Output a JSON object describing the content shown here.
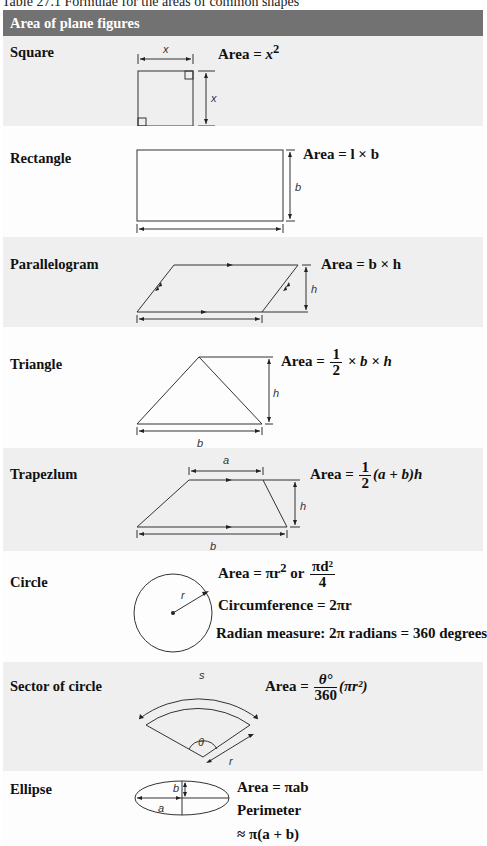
{
  "caption": "Table 27.1 Formulae for the areas of common shapes",
  "header": {
    "title": "Area of plane figures",
    "bg_color": "#727272"
  },
  "rows": [
    {
      "label": "Square",
      "dims": {
        "side_top": "x",
        "side_right": "x"
      },
      "formula": {
        "prefix": "Area = ",
        "var": "x",
        "sup": "2"
      }
    },
    {
      "label": "Rectangle",
      "dims": {
        "height": "b",
        "length": "l"
      },
      "formula": {
        "text": "Area = l × b"
      }
    },
    {
      "label": "Parallelogram",
      "dims": {
        "height": "h",
        "base": "b"
      },
      "formula": {
        "text": "Area = b × h"
      }
    },
    {
      "label": "Triangle",
      "dims": {
        "height": "h",
        "base": "b"
      },
      "formula": {
        "prefix": "Area = ",
        "num": "1",
        "den": "2",
        "suffix": " × b × h"
      }
    },
    {
      "label": "Trapezlum",
      "dims": {
        "top": "a",
        "height": "h",
        "base": "b"
      },
      "formula": {
        "prefix": "Area = ",
        "num": "1",
        "den": "2",
        "suffix": "(a + b)h"
      }
    },
    {
      "label": "Circle",
      "dims": {
        "radius": "r"
      },
      "formula": {
        "area_prefix": "Area = πr",
        "area_sup": "2",
        "or": " or ",
        "num": "πd²",
        "den": "4",
        "circumference": "Circumference = 2πr",
        "radian": "Radian measure: 2π radians = 360 degrees"
      }
    },
    {
      "label": "Sector of circle",
      "dims": {
        "arc": "s",
        "angle": "θ",
        "radius": "r"
      },
      "formula": {
        "prefix": "Area = ",
        "num": "θ°",
        "den": "360",
        "suffix": "(πr²)"
      }
    },
    {
      "label": "Ellipse",
      "dims": {
        "semi_major": "a",
        "semi_minor": "b"
      },
      "formula": {
        "area": "Area = πab",
        "perimeter_label": "Perimeter",
        "perimeter_value": "≈ π(a + b)"
      }
    }
  ],
  "colors": {
    "shade_row": "#efefef",
    "plain_row": "#fdfdfd",
    "line": "#333333"
  }
}
